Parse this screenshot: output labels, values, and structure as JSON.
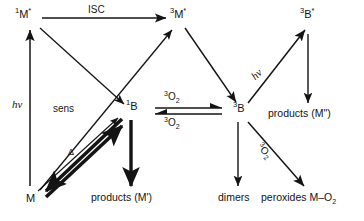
{
  "diagram": {
    "background_color": "#ffffff",
    "stroke_color": "#141414",
    "nodes": {
      "singlet_m_excited": "1M*",
      "triplet_m_excited": "3M*",
      "triplet_b_excited": "3B*",
      "singlet_b": "1B",
      "triplet_b": "3B",
      "ground_m": "M"
    },
    "node_parts": {
      "singlet_m_excited": {
        "pre": "1",
        "base": "M",
        "post": "*"
      },
      "triplet_m_excited": {
        "pre": "3",
        "base": "M",
        "post": "*"
      },
      "triplet_b_excited": {
        "pre": "3",
        "base": "B",
        "post": "*"
      },
      "singlet_b": {
        "pre": "1",
        "base": "B",
        "post": ""
      },
      "triplet_b": {
        "pre": "3",
        "base": "B",
        "post": ""
      },
      "ground_m": {
        "pre": "",
        "base": "M",
        "post": ""
      }
    },
    "edge_labels": {
      "isc": "ISC",
      "hv_left": "hv",
      "hv_right": "hv",
      "sens": "sens",
      "delta": "Δ",
      "o2_upper": {
        "pre": "3",
        "base": "O",
        "sub": "2"
      },
      "o2_lower": {
        "pre": "3",
        "base": "O",
        "sub": "2"
      },
      "o2_diagonal": {
        "pre": "3",
        "base": "O",
        "sub": "2"
      }
    },
    "terminals": {
      "products_m_prime": "products (M')",
      "products_m_double_prime": "products (M\")",
      "dimers": "dimers",
      "peroxides": {
        "text": "peroxides M–O",
        "sub": "2"
      }
    }
  }
}
